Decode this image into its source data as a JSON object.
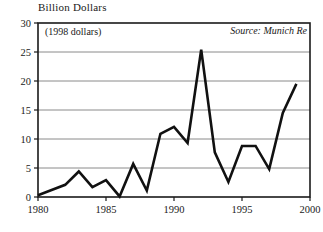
{
  "chart_data": {
    "type": "line",
    "title": "Billion Dollars",
    "subtitle": "(1998 dollars)",
    "source_note": "Source: Munich Re",
    "xlabel": "",
    "ylabel": "Billion Dollars",
    "xlim": [
      1980,
      2000
    ],
    "ylim": [
      0,
      30
    ],
    "grid": true,
    "legend": "none",
    "xticks": [
      1980,
      1985,
      1990,
      1995,
      2000
    ],
    "xtick_labels": [
      "1980",
      "1985",
      "1990",
      "1995",
      "2000"
    ],
    "yticks": [
      0,
      5,
      10,
      15,
      20,
      25,
      30
    ],
    "ytick_labels": [
      "0",
      "5",
      "10",
      "15",
      "20",
      "25",
      "30"
    ],
    "line_color": "#111111",
    "grid_color": "#8a8a8a",
    "axis_color": "#1a1a1a",
    "x": [
      1980,
      1981,
      1982,
      1983,
      1984,
      1985,
      1986,
      1987,
      1988,
      1989,
      1990,
      1991,
      1992,
      1993,
      1994,
      1995,
      1996,
      1997,
      1998,
      1999
    ],
    "values": [
      0.3,
      1.2,
      2.1,
      4.4,
      1.7,
      2.9,
      0.1,
      5.7,
      1.1,
      10.9,
      12.1,
      9.3,
      25.4,
      7.7,
      2.6,
      8.8,
      8.8,
      4.8,
      14.5,
      19.5
    ],
    "series": [
      {
        "name": "Weather-related insured losses",
        "values": [
          0.3,
          1.2,
          2.1,
          4.4,
          1.7,
          2.9,
          0.1,
          5.7,
          1.1,
          10.9,
          12.1,
          9.3,
          25.4,
          7.7,
          2.6,
          8.8,
          8.8,
          4.8,
          14.5,
          19.5
        ]
      }
    ]
  },
  "labels": {
    "axis_title": "Billion Dollars",
    "dollars_note": "(1998 dollars)",
    "source": "Source: Munich Re"
  }
}
